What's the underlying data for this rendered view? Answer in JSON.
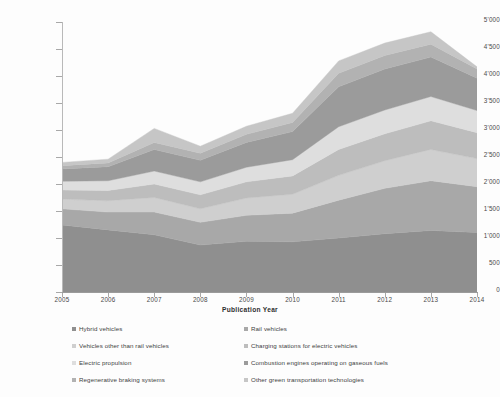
{
  "chart_data": {
    "type": "area",
    "title": "",
    "xlabel": "Publication Year",
    "ylabel": "Internationally oriented patent families",
    "x": [
      2005,
      2006,
      2007,
      2008,
      2009,
      2010,
      2011,
      2012,
      2013,
      2014
    ],
    "xtick_labels": [
      "2005",
      "2006",
      "2007",
      "2008",
      "2009",
      "2010",
      "2011",
      "2012",
      "2013",
      "2014"
    ],
    "ytick_labels": [
      "0",
      "500",
      "1'000",
      "1'500",
      "2'000",
      "2'500",
      "3'000",
      "3'500",
      "4'000",
      "4'500",
      "5'000"
    ],
    "ytick_values": [
      0,
      500,
      1000,
      1500,
      2000,
      2500,
      3000,
      3500,
      4000,
      4500,
      5000
    ],
    "ylim": [
      0,
      5000
    ],
    "grid": false,
    "stacked": true,
    "legend_position": "bottom",
    "series": [
      {
        "name": "Hybrid vehicles",
        "color": "#8f8f8f",
        "values": [
          1240,
          1150,
          1060,
          870,
          940,
          930,
          1000,
          1080,
          1140,
          1100
        ]
      },
      {
        "name": "Rail vehicles",
        "color": "#a8a8a8",
        "values": [
          300,
          330,
          420,
          420,
          480,
          530,
          700,
          840,
          920,
          850
        ]
      },
      {
        "name": "Vehicles other than rail vehicles",
        "color": "#cfcfcf",
        "values": [
          180,
          210,
          270,
          250,
          320,
          350,
          460,
          510,
          580,
          520
        ]
      },
      {
        "name": "Charging stations for electric vehicles",
        "color": "#bdbdbd",
        "values": [
          170,
          190,
          250,
          260,
          300,
          340,
          480,
          500,
          530,
          480
        ]
      },
      {
        "name": "Electric propulsion",
        "color": "#dedede",
        "values": [
          160,
          180,
          240,
          240,
          270,
          300,
          420,
          440,
          450,
          410
        ]
      },
      {
        "name": "Combustion engines operating on gaseous fuels",
        "color": "#9b9b9b",
        "values": [
          230,
          260,
          400,
          400,
          460,
          520,
          740,
          760,
          730,
          600
        ]
      },
      {
        "name": "Regenerative braking systems",
        "color": "#b2b2b2",
        "values": [
          60,
          70,
          130,
          130,
          150,
          170,
          250,
          250,
          240,
          170
        ]
      },
      {
        "name": "Other green transportation technologies",
        "color": "#c6c6c6",
        "values": [
          60,
          70,
          260,
          130,
          150,
          170,
          230,
          230,
          230,
          40
        ]
      }
    ],
    "legend_order": [
      "Hybrid vehicles",
      "Rail vehicles",
      "Vehicles other than rail vehicles",
      "Charging stations for electric vehicles",
      "Electric propulsion",
      "Combustion engines operating on gaseous fuels",
      "Regenerative braking systems",
      "Other green transportation technologies"
    ]
  }
}
